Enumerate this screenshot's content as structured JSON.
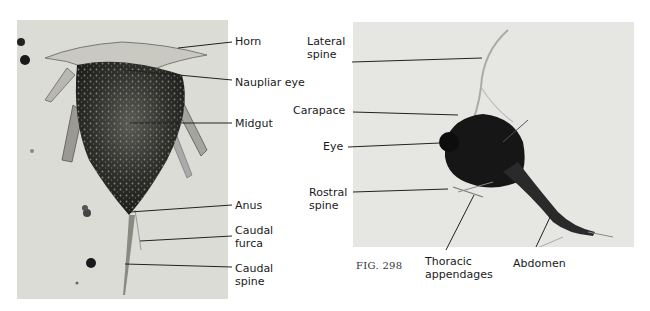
{
  "figure": {
    "number_label": "FIG. 298",
    "left_panel": {
      "description": "Nauplius larva micrograph",
      "labels": [
        {
          "id": "horn",
          "text": "Horn"
        },
        {
          "id": "naupliar-eye",
          "text": "Naupliar eye"
        },
        {
          "id": "midgut",
          "text": "Midgut"
        },
        {
          "id": "anus",
          "text": "Anus"
        },
        {
          "id": "caudal-furca",
          "text": "Caudal\nfurca"
        },
        {
          "id": "caudal-spine",
          "text": "Caudal\nspine"
        }
      ]
    },
    "right_panel": {
      "description": "Zoea larva micrograph",
      "labels": [
        {
          "id": "lateral-spine",
          "text": "Lateral\nspine"
        },
        {
          "id": "carapace",
          "text": "Carapace"
        },
        {
          "id": "eye",
          "text": "Eye"
        },
        {
          "id": "rostral-spine",
          "text": "Rostral\nspine"
        },
        {
          "id": "thoracic-appendages",
          "text": "Thoracic\nappendages"
        },
        {
          "id": "abdomen",
          "text": "Abdomen"
        }
      ]
    }
  },
  "colors": {
    "left_photo_bg": "#dcdcd6",
    "right_photo_bg": "#e6e6e2",
    "specimen_dark": "#1e1e1e",
    "leader_line": "#222222"
  }
}
